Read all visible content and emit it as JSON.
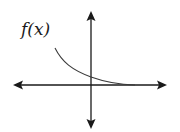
{
  "diagram": {
    "label": "f(x)",
    "colors": {
      "axes": "#1a1a1a",
      "curve": "#3a3a3a",
      "background": "#ffffff"
    },
    "axes": {
      "x_axis": {
        "from": [
          14,
          85
        ],
        "to": [
          166,
          85
        ],
        "arrows": "both"
      },
      "y_axis": {
        "from": [
          91,
          12
        ],
        "to": [
          91,
          128
        ],
        "arrows": "both"
      },
      "origin_px": [
        91,
        85
      ]
    },
    "curve": {
      "type": "exponential-decay",
      "start_px": [
        55,
        48
      ],
      "y_intercept_px": [
        91,
        77
      ],
      "end_px": [
        135,
        85
      ]
    }
  }
}
